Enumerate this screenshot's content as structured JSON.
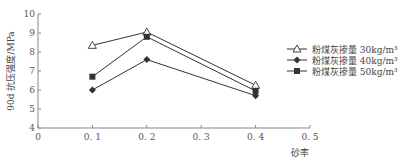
{
  "chart_data": {
    "type": "line",
    "title": "",
    "xlabel": "砂率",
    "ylabel": "90d 抗压强度/MPa",
    "x": [
      0.1,
      0.2,
      0.4
    ],
    "xlim": [
      0,
      0.5
    ],
    "ylim": [
      4,
      10
    ],
    "xticks": [
      "0",
      "0.1",
      "0.2",
      "0.3",
      "0.4",
      "0.5"
    ],
    "yticks": [
      "4",
      "5",
      "6",
      "7",
      "8",
      "9",
      "10"
    ],
    "grid": false,
    "legend_position": "upper right",
    "series": [
      {
        "name": "粉煤灰掺量 30kg/m³",
        "marker": "triangle-open",
        "values": [
          8.35,
          9.05,
          6.25
        ]
      },
      {
        "name": "粉煤灰掺量 40kg/m³",
        "marker": "diamond-filled",
        "values": [
          6.0,
          7.6,
          5.7
        ]
      },
      {
        "name": "粉煤灰掺量 50kg/m³",
        "marker": "square-filled",
        "values": [
          6.7,
          8.8,
          5.95
        ]
      }
    ]
  },
  "colors": {
    "line": "#333333",
    "axis": "#888888",
    "text": "#555555"
  }
}
